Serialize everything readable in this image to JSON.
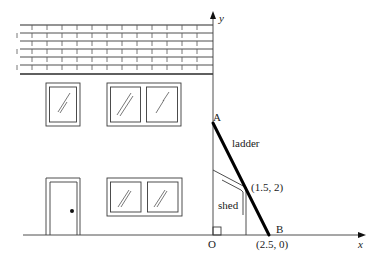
{
  "diagram": {
    "axes": {
      "x_label": "x",
      "y_label": "y",
      "origin_label": "O"
    },
    "points": {
      "A": {
        "label": "A"
      },
      "B": {
        "label": "B",
        "coord_label": "(2.5, 0)"
      },
      "shed_corner": {
        "coord_label": "(1.5, 2)"
      }
    },
    "labels": {
      "ladder": "ladder",
      "shed": "shed"
    },
    "house": {
      "roof_rows": 6,
      "upper_windows": [
        {
          "panes": 1
        },
        {
          "panes": 2
        }
      ],
      "lower_windows": [
        {
          "panes": 2
        }
      ],
      "door": {
        "has_knob": true
      }
    },
    "colors": {
      "line": "#2a2a2a",
      "ladder": "#000000",
      "background": "#ffffff"
    }
  }
}
